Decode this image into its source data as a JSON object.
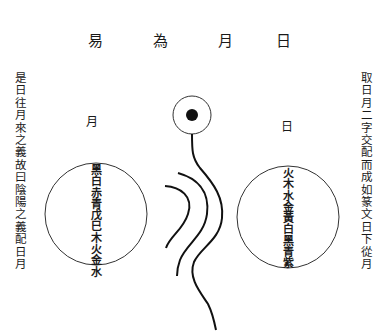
{
  "title": {
    "chars": [
      "易",
      "為",
      "月",
      "日"
    ]
  },
  "left_annotation": "是日往月來之義故曰陰陽之義配日月",
  "right_annotation": "取日月二字交配而成如篆文日下從月",
  "left_circle": {
    "label": "月",
    "text": "黑白赤青戊巳木火金水"
  },
  "right_circle": {
    "label": "日",
    "text": "火木水金黃白黑青紫"
  },
  "center_figure": {
    "top_symbol": "sun-circle-with-dot",
    "lines": [
      "main-serpentine-line",
      "middle-curve",
      "left-curve"
    ]
  },
  "colors": {
    "ink": "#1a1a1a",
    "paper": "#ffffff"
  }
}
